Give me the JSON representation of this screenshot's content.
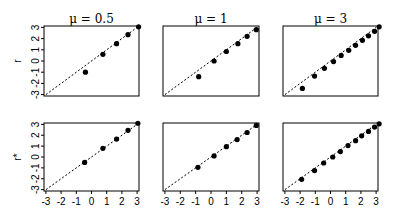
{
  "chart_data": {
    "type": "scatter",
    "layout": "2x3 grid",
    "reference_line": "y = x (dashed)",
    "xlim": [
      -3,
      3
    ],
    "ylim": [
      -3,
      3
    ],
    "x_ticks": [
      "-3",
      "-2",
      "-1",
      "0",
      "1",
      "2",
      "3"
    ],
    "y_ticks": [
      "-3",
      "-2",
      "-1",
      "0",
      "1",
      "2",
      "3"
    ],
    "column_titles": [
      "μ = 0.5",
      "μ = 1",
      "μ = 3"
    ],
    "row_labels": [
      "r",
      "r*"
    ],
    "panels": [
      {
        "row": 0,
        "col": 0,
        "title": "μ = 0.5",
        "ylabel": "r",
        "x": [
          -0.4,
          0.75,
          1.65,
          2.4,
          3.1
        ],
        "y": [
          -1.0,
          0.6,
          1.55,
          2.35,
          3.05
        ]
      },
      {
        "row": 0,
        "col": 1,
        "title": "μ = 1",
        "ylabel": "",
        "x": [
          -0.8,
          0.2,
          1.0,
          1.75,
          2.35,
          2.95
        ],
        "y": [
          -1.4,
          0.0,
          0.85,
          1.55,
          2.2,
          2.8
        ]
      },
      {
        "row": 0,
        "col": 2,
        "title": "μ = 3",
        "ylabel": "",
        "x": [
          -1.85,
          -1.05,
          -0.4,
          0.2,
          0.7,
          1.2,
          1.65,
          2.1,
          2.5,
          2.9,
          3.2
        ],
        "y": [
          -2.45,
          -1.35,
          -0.65,
          -0.05,
          0.5,
          0.95,
          1.4,
          1.85,
          2.25,
          2.65,
          3.05
        ]
      },
      {
        "row": 1,
        "col": 0,
        "title": "",
        "ylabel": "r*",
        "x": [
          -0.45,
          0.75,
          1.65,
          2.4,
          3.05
        ],
        "y": [
          -0.5,
          0.8,
          1.65,
          2.45,
          3.1
        ]
      },
      {
        "row": 1,
        "col": 1,
        "title": "",
        "ylabel": "",
        "x": [
          -0.85,
          0.2,
          1.0,
          1.7,
          2.35,
          2.95
        ],
        "y": [
          -0.95,
          0.1,
          0.95,
          1.6,
          2.25,
          2.9
        ]
      },
      {
        "row": 1,
        "col": 2,
        "title": "",
        "ylabel": "",
        "x": [
          -1.9,
          -1.05,
          -0.45,
          0.15,
          0.65,
          1.15,
          1.65,
          2.05,
          2.5,
          2.9,
          3.2
        ],
        "y": [
          -2.05,
          -1.25,
          -0.55,
          0.0,
          0.5,
          1.05,
          1.5,
          1.95,
          2.35,
          2.75,
          3.05
        ]
      }
    ],
    "grid": false
  }
}
